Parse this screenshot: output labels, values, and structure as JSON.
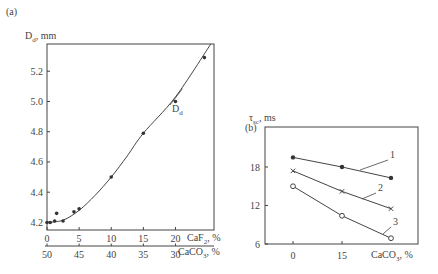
{
  "chart_data": [
    {
      "panel": "(a)",
      "type": "scatter",
      "title": "",
      "ylabel": "D_d, mm",
      "xlabel_primary": "CaF2, %",
      "xlabel_secondary": "CaCO3, %",
      "x_ticks_primary": [
        0,
        5,
        10,
        15,
        20
      ],
      "x_ticks_secondary": [
        50,
        45,
        40,
        35,
        30
      ],
      "y_ticks": [
        4.2,
        4.4,
        4.6,
        4.8,
        5.0,
        5.2
      ],
      "xlim": [
        0,
        26
      ],
      "ylim": [
        4.15,
        5.38
      ],
      "grid": false,
      "series": [
        {
          "name": "D_d",
          "marker": "filled-circle",
          "points": [
            {
              "x": 0,
              "y": 4.2
            },
            {
              "x": 0.5,
              "y": 4.2
            },
            {
              "x": 1.2,
              "y": 4.21
            },
            {
              "x": 1.5,
              "y": 4.26
            },
            {
              "x": 2.5,
              "y": 4.21
            },
            {
              "x": 4.2,
              "y": 4.27
            },
            {
              "x": 5,
              "y": 4.29
            },
            {
              "x": 10,
              "y": 4.5
            },
            {
              "x": 15,
              "y": 4.79
            },
            {
              "x": 20,
              "y": 5.0
            },
            {
              "x": 24.5,
              "y": 5.29
            }
          ],
          "curve": [
            {
              "x": 0,
              "y": 4.2
            },
            {
              "x": 2.5,
              "y": 4.215
            },
            {
              "x": 5,
              "y": 4.28
            },
            {
              "x": 7.5,
              "y": 4.38
            },
            {
              "x": 10,
              "y": 4.5
            },
            {
              "x": 12.5,
              "y": 4.64
            },
            {
              "x": 15,
              "y": 4.79
            },
            {
              "x": 20,
              "y": 5.03
            },
            {
              "x": 25.5,
              "y": 5.38
            }
          ],
          "curve_label": "D_d"
        }
      ]
    },
    {
      "panel": "(b)",
      "type": "line",
      "title": "",
      "ylabel": "τ_sc, ms",
      "xlabel": "CaCO3, %",
      "x_ticks": [
        0,
        15
      ],
      "y_ticks": [
        6,
        12,
        18
      ],
      "xlim": [
        -8,
        36
      ],
      "ylim": [
        6,
        28
      ],
      "grid": false,
      "series": [
        {
          "name": "1",
          "marker": "filled-circle",
          "x": [
            0,
            15,
            30
          ],
          "y": [
            19.5,
            18,
            16.3
          ]
        },
        {
          "name": "2",
          "marker": "cross",
          "x": [
            0,
            15,
            30
          ],
          "y": [
            17.4,
            14.2,
            11.5
          ]
        },
        {
          "name": "3",
          "marker": "open-circle",
          "x": [
            0,
            15,
            30
          ],
          "y": [
            15,
            10.4,
            6.9
          ]
        }
      ]
    }
  ],
  "labels": {
    "panel_a": "(a)",
    "panel_b": "(b)",
    "a_ylabel_main": "D",
    "a_ylabel_sub": "d",
    "a_ylabel_unit": ", mm",
    "a_curve_main": "D",
    "a_curve_sub": "d",
    "a_xlabel1_main": "CaF",
    "a_xlabel1_sub": "2",
    "a_xlabel1_unit": ", %",
    "a_xlabel2_main": "CaCO",
    "a_xlabel2_sub": "3",
    "a_xlabel2_unit": ", %",
    "b_ylabel_main": "τ",
    "b_ylabel_sub": "sc",
    "b_ylabel_unit": ", ms",
    "b_xlabel_main": "CaCO",
    "b_xlabel_sub": "3",
    "b_xlabel_unit": ", %",
    "a_yticks": [
      "4.2",
      "4.4",
      "4.6",
      "4.8",
      "5.0",
      "5.2"
    ],
    "a_xticks1": [
      "0",
      "5",
      "10",
      "15",
      "20"
    ],
    "a_xticks2": [
      "50",
      "45",
      "40",
      "35",
      "30"
    ],
    "b_yticks": [
      "6",
      "12",
      "18"
    ],
    "b_xticks": [
      "0",
      "15"
    ],
    "b_series_labels": [
      "1",
      "2",
      "3"
    ]
  }
}
